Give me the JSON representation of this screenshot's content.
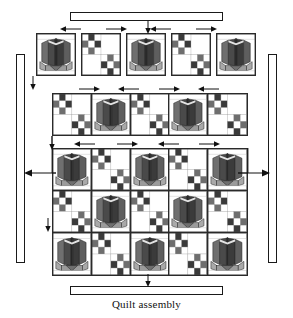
{
  "diagram": {
    "caption": "Quilt assembly",
    "title": "Quilt assembly"
  },
  "palette": {
    "outline": "#2a2a2a",
    "background": "#ffffff",
    "flower_dark": "#2b2b2b",
    "flower_mid": "#555555",
    "flower_light": "#7d7d7d",
    "leaf_light": "#a9a9a9",
    "leaf_mid": "#8c8c8c",
    "patch_dark": "#3a3a3a",
    "patch_mid": "#6e6e6e",
    "patch_light": "#b5b5b5",
    "patch_white": "#ffffff"
  },
  "borders": [
    {
      "name": "top-border-strip",
      "orientation": "horizontal",
      "position": "top"
    },
    {
      "name": "bottom-border-strip",
      "orientation": "horizontal",
      "position": "bottom"
    },
    {
      "name": "left-border-strip",
      "orientation": "vertical",
      "position": "left"
    },
    {
      "name": "right-border-strip",
      "orientation": "vertical",
      "position": "right"
    }
  ],
  "rows": [
    {
      "name": "row-1",
      "joined": false,
      "blocks": [
        "tulip",
        "ninepatch",
        "tulip",
        "ninepatch",
        "tulip"
      ],
      "arrows": [
        "left",
        "right",
        "left",
        "right"
      ]
    },
    {
      "name": "row-2",
      "joined": true,
      "blocks": [
        "ninepatch",
        "tulip",
        "ninepatch",
        "tulip",
        "ninepatch"
      ],
      "arrows": [
        "right",
        "left",
        "right",
        "left"
      ]
    },
    {
      "name": "quilt-body-row-1",
      "joined": true,
      "blocks": [
        "tulip",
        "ninepatch",
        "tulip",
        "ninepatch",
        "tulip"
      ],
      "arrows": [
        "left",
        "right",
        "left",
        "right"
      ]
    },
    {
      "name": "quilt-body-row-2",
      "joined": true,
      "blocks": [
        "ninepatch",
        "tulip",
        "ninepatch",
        "tulip",
        "ninepatch"
      ],
      "arrows": []
    },
    {
      "name": "quilt-body-row-3",
      "joined": true,
      "blocks": [
        "tulip",
        "ninepatch",
        "tulip",
        "ninepatch",
        "tulip"
      ],
      "arrows": []
    }
  ],
  "assembly_arrows": [
    {
      "name": "top-border-attach-arrow",
      "direction": "down"
    },
    {
      "name": "bottom-border-attach-arrow",
      "direction": "down"
    },
    {
      "name": "left-border-attach-arrow",
      "direction": "left"
    },
    {
      "name": "right-border-attach-arrow",
      "direction": "right"
    },
    {
      "name": "row1-join-arrow",
      "direction": "down"
    },
    {
      "name": "row2-join-arrow",
      "direction": "down"
    },
    {
      "name": "body-join-arrow",
      "direction": "down"
    }
  ]
}
